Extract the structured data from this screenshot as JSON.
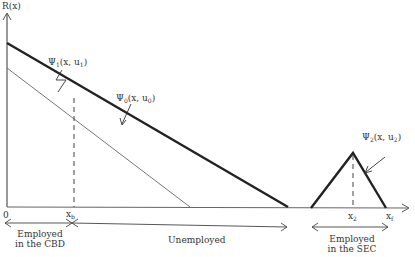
{
  "diagram": {
    "y_axis_label": "R(x)",
    "origin_label": "0",
    "curves": {
      "psi1": {
        "name": "Ψ",
        "sub": "1",
        "args": "(x, u",
        "argsub": "1",
        "close": ")"
      },
      "psi0": {
        "name": "Ψ",
        "sub": "0",
        "args": "(x, u",
        "argsub": "0",
        "close": ")"
      },
      "psi2": {
        "name": "Ψ",
        "sub": "2",
        "args": "(x, u",
        "argsub": "2",
        "close": ")"
      }
    },
    "x_ticks": {
      "xb": {
        "base": "x",
        "sub": "b"
      },
      "x2": {
        "base": "x",
        "sub": "2"
      },
      "xf": {
        "base": "x",
        "sub": "f"
      }
    },
    "regions": {
      "cbd": {
        "line1": "Employed",
        "line2": "in the CBD"
      },
      "unemployed": {
        "label": "Unemployed"
      },
      "sec": {
        "line1": "Employed",
        "line2": "in the SEC"
      }
    },
    "colors": {
      "thick_line": "#222222",
      "thin_line": "#777777",
      "axis": "#555555"
    }
  }
}
